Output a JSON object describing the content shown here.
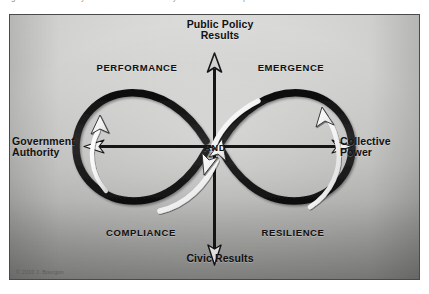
{
  "page": {
    "caption": "Figure 1. The New Synthesis Framework: a dynamic balance of public results and civic results"
  },
  "figure": {
    "axes": {
      "vertical": {
        "top_label": "Public Policy\nResults",
        "bottom_label": "Civic Results",
        "color": "#1a1a1a"
      },
      "horizontal": {
        "left_label": "Government\nAuthority",
        "right_label": "Collective\nPower",
        "color": "#1a1a1a"
      },
      "center_label": "AND"
    },
    "quadrants": [
      {
        "key": "upper-left",
        "label": "PERFORMANCE"
      },
      {
        "key": "upper-right",
        "label": "EMERGENCE"
      },
      {
        "key": "lower-left",
        "label": "COMPLIANCE"
      },
      {
        "key": "lower-right",
        "label": "RESILIENCE"
      }
    ],
    "loops": {
      "shape": "infinity",
      "ribbon_color": "#171717",
      "flow_arrow_color": "#fbfbfb",
      "count": 2
    },
    "copyright": "© 2010 J. Bourgon",
    "colors": {
      "panel_light": "#d8d8d6",
      "panel_dark": "#979795",
      "frame": "#4a4a4a",
      "ink": "#111111",
      "white_arrow": "#fbfbfb"
    }
  }
}
